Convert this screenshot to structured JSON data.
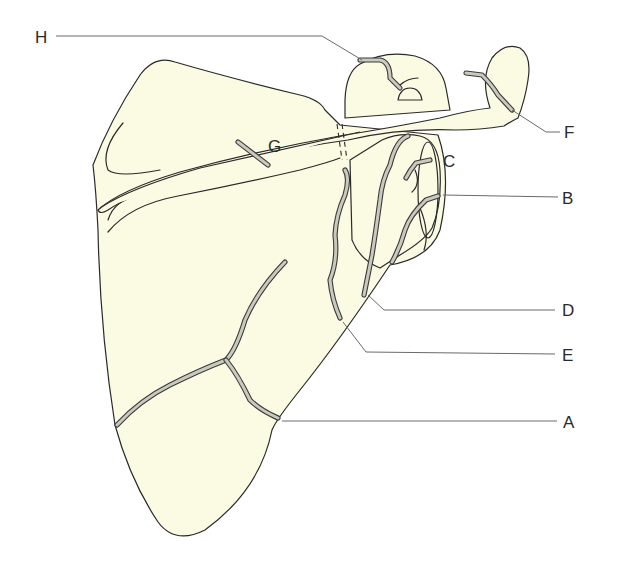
{
  "diagram": {
    "colors": {
      "bone_fill": "#fbfbe3",
      "outline": "#2a2a2a",
      "fracture_line": "#c9c9bd",
      "leader_line": "#6a6a6a"
    },
    "labels": {
      "A": "A",
      "B": "B",
      "C": "C",
      "D": "D",
      "E": "E",
      "F": "F",
      "G": "G",
      "H": "H"
    }
  }
}
